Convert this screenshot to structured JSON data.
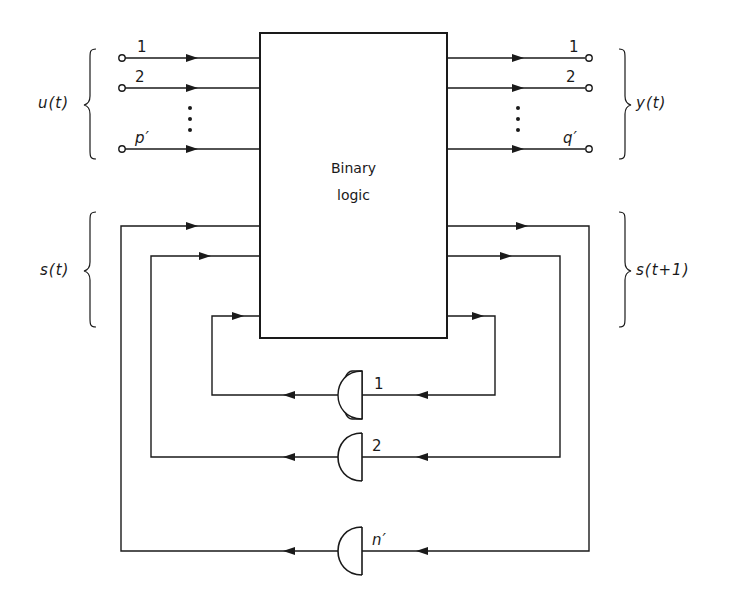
{
  "diagram": {
    "type": "sequential-circuit-block-diagram",
    "block": {
      "line1": "Binary",
      "line2": "logic"
    },
    "inputs": {
      "group_label": "u(t)",
      "lines": [
        {
          "label": "1"
        },
        {
          "label": "2"
        },
        {
          "label": "p′"
        }
      ],
      "ellipsis": "⋮"
    },
    "outputs": {
      "group_label": "y(t)",
      "lines": [
        {
          "label": "1"
        },
        {
          "label": "2"
        },
        {
          "label": "q′"
        }
      ],
      "ellipsis": "⋮"
    },
    "state_in": {
      "group_label": "s(t)"
    },
    "state_out": {
      "group_label": "s(t+1)"
    },
    "delays": [
      {
        "label": "1"
      },
      {
        "label": "2"
      },
      {
        "label": "n′"
      }
    ],
    "colors": {
      "line": "#1a1a1a",
      "background": "#ffffff"
    }
  }
}
